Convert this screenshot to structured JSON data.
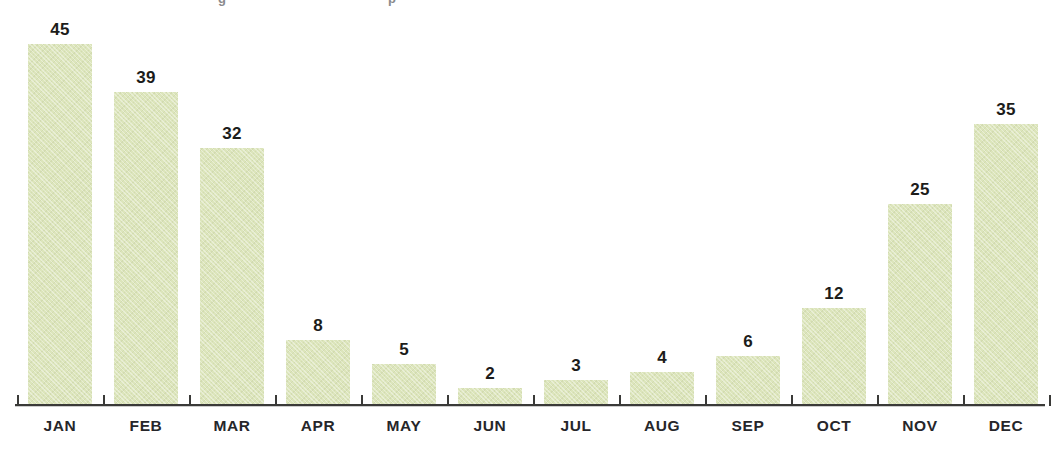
{
  "chart_data": {
    "type": "bar",
    "title": "",
    "xlabel": "",
    "ylabel": "",
    "grid": false,
    "legend": false,
    "axis_line": true,
    "value_labels": true,
    "ylim": [
      0,
      45
    ],
    "categories": [
      "JAN",
      "FEB",
      "MAR",
      "APR",
      "MAY",
      "JUN",
      "JUL",
      "AUG",
      "SEP",
      "OCT",
      "NOV",
      "DEC"
    ],
    "values": [
      45,
      39,
      32,
      8,
      5,
      2,
      3,
      4,
      6,
      12,
      25,
      35
    ],
    "series": [
      {
        "name": "",
        "values": [
          45,
          39,
          32,
          8,
          5,
          2,
          3,
          4,
          6,
          12,
          25,
          35
        ]
      }
    ],
    "bars": [
      {
        "category": "JAN",
        "value": 45,
        "label": "45"
      },
      {
        "category": "FEB",
        "value": 39,
        "label": "39"
      },
      {
        "category": "MAR",
        "value": 32,
        "label": "32"
      },
      {
        "category": "APR",
        "value": 8,
        "label": "8"
      },
      {
        "category": "MAY",
        "value": 5,
        "label": "5"
      },
      {
        "category": "JUN",
        "value": 2,
        "label": "2"
      },
      {
        "category": "JUL",
        "value": 3,
        "label": "3"
      },
      {
        "category": "AUG",
        "value": 4,
        "label": "4"
      },
      {
        "category": "SEP",
        "value": 6,
        "label": "6"
      },
      {
        "category": "OCT",
        "value": 12,
        "label": "12"
      },
      {
        "category": "NOV",
        "value": 25,
        "label": "25"
      },
      {
        "category": "DEC",
        "value": 35,
        "label": "35"
      }
    ],
    "colors": {
      "bar_fill": "#dce5bb",
      "axis": "#3a3a38",
      "value_label": "#1c1c1a",
      "category_label": "#26262a",
      "background": "#ffffff"
    }
  }
}
